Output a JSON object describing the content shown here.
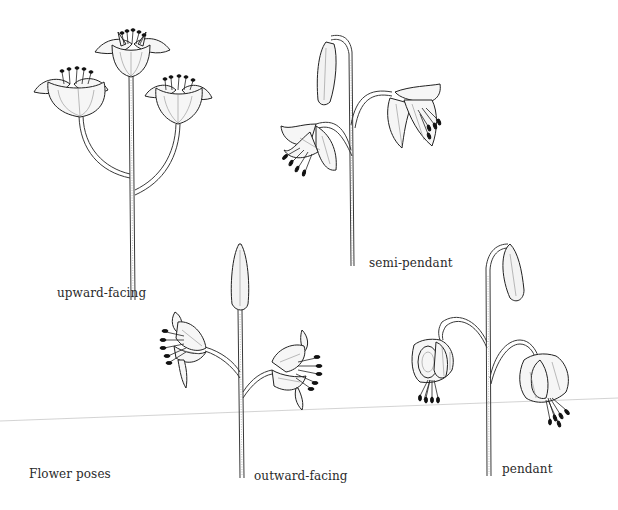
{
  "figure": {
    "caption": "Flower poses",
    "poses": [
      {
        "id": "upward-facing",
        "label": "upward-facing",
        "flowers": 3,
        "buds": 0
      },
      {
        "id": "semi-pendant",
        "label": "semi-pendant",
        "flowers": 2,
        "buds": 1
      },
      {
        "id": "outward-facing",
        "label": "outward-facing",
        "flowers": 2,
        "buds": 1
      },
      {
        "id": "pendant",
        "label": "pendant",
        "flowers": 2,
        "buds": 1
      }
    ]
  },
  "colors": {
    "background": "#ffffff",
    "ink": "#222222",
    "rule": "#c8c8c8"
  }
}
